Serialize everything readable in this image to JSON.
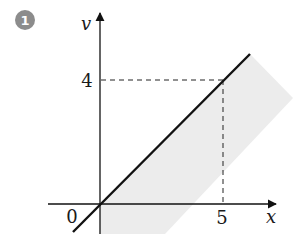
{
  "figure": {
    "badge_number": "1",
    "y_axis_label": "v",
    "x_axis_label": "x",
    "origin_label": "0",
    "y_tick_label": "4",
    "x_tick_label": "5"
  },
  "colors": {
    "badge": "#8c8c8c",
    "shade": "#ececec",
    "line": "#111111"
  },
  "diagram": {
    "type": "coordinate-plot",
    "point": {
      "x": 5,
      "y": 4
    },
    "line": "y = (4/5)x"
  }
}
